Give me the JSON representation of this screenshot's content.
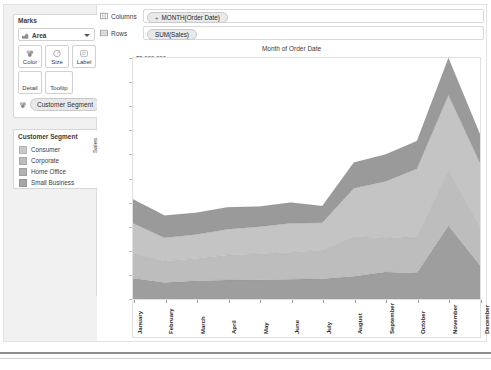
{
  "marks_card": {
    "title": "Marks",
    "mark_type": "Area",
    "mark_type_icon": "area-chart-icon",
    "dropdown_icon": "chevron-down-icon",
    "buttons": [
      {
        "label": "Color",
        "icon": "color-palette-icon"
      },
      {
        "label": "Size",
        "icon": "size-circle-icon"
      },
      {
        "label": "Label",
        "icon": "label-tag-icon"
      },
      {
        "label": "Detail",
        "icon": "detail-icon"
      },
      {
        "label": "Tooltip",
        "icon": "tooltip-icon"
      }
    ],
    "encoding_pill": {
      "label": "Customer Segment",
      "icon": "color-palette-icon"
    }
  },
  "legend": {
    "title": "Customer Segment",
    "items": [
      {
        "label": "Consumer",
        "color": "#c9c9c9"
      },
      {
        "label": "Corporate",
        "color": "#bdbdbd"
      },
      {
        "label": "Home Office",
        "color": "#b2b2b2"
      },
      {
        "label": "Small Business",
        "color": "#a6a6a6"
      }
    ]
  },
  "shelves": {
    "columns": {
      "name": "Columns",
      "icon": "columns-shelf-icon",
      "pill": "MONTH(Order Date)",
      "pill_prefix": "+"
    },
    "rows": {
      "name": "Rows",
      "icon": "rows-shelf-icon",
      "pill": "SUM(Sales)",
      "pill_prefix": ""
    }
  },
  "viz": {
    "title": "Month of Order Date"
  },
  "chart_data": {
    "type": "area",
    "stacked": true,
    "title": "Month of Order Date",
    "xlabel": "",
    "ylabel": "Sales",
    "ylim": [
      0,
      5000000
    ],
    "ytick_labels": [
      "$5,000,000",
      "$4,500,000",
      "$4,000,000",
      "$3,500,000",
      "$3,000,000",
      "$2,500,000",
      "$2,000,000",
      "$1,500,000",
      "$1,000,000",
      "$500,000",
      "$0"
    ],
    "ytick_values": [
      5000000,
      4500000,
      4000000,
      3500000,
      3000000,
      2500000,
      2000000,
      1500000,
      1000000,
      500000,
      0
    ],
    "grid": false,
    "legend_position": "left-panel",
    "categories": [
      "January",
      "February",
      "March",
      "April",
      "May",
      "June",
      "July",
      "August",
      "September",
      "October",
      "November",
      "December"
    ],
    "series": [
      {
        "name": "Consumer",
        "color": "#9e9e9e",
        "values": [
          430000,
          340000,
          380000,
          395000,
          400000,
          410000,
          420000,
          470000,
          560000,
          540000,
          1520000,
          700000
        ]
      },
      {
        "name": "Corporate",
        "color": "#bdbdbd",
        "values": [
          520000,
          450000,
          460000,
          520000,
          540000,
          560000,
          590000,
          830000,
          700000,
          760000,
          1150000,
          800000
        ]
      },
      {
        "name": "Home Office",
        "color": "#c4c4c4",
        "values": [
          620000,
          480000,
          500000,
          530000,
          560000,
          600000,
          570000,
          1000000,
          1180000,
          1400000,
          1560000,
          1320000
        ]
      },
      {
        "name": "Small Business",
        "color": "#9a9a9a",
        "values": [
          500000,
          460000,
          450000,
          460000,
          420000,
          430000,
          350000,
          530000,
          560000,
          580000,
          770000,
          600000
        ]
      }
    ],
    "totals": [
      2070000,
      1730000,
      1790000,
      1905000,
      1920000,
      2000000,
      1930000,
      2830000,
      3000000,
      3280000,
      5000000,
      3420000
    ]
  }
}
